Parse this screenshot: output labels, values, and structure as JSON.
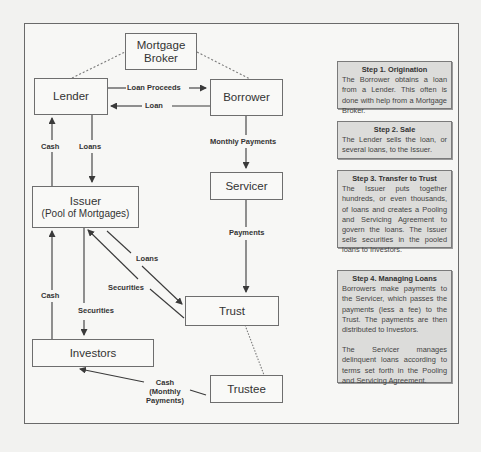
{
  "diagram": {
    "nodes": {
      "mortgage_broker": {
        "line1": "Mortgage",
        "line2": "Broker"
      },
      "lender": {
        "label": "Lender"
      },
      "borrower": {
        "label": "Borrower"
      },
      "issuer": {
        "label": "Issuer",
        "sub": "(Pool of Mortgages)"
      },
      "servicer": {
        "label": "Servicer"
      },
      "trust": {
        "label": "Trust"
      },
      "investors": {
        "label": "Investors"
      },
      "trustee": {
        "label": "Trustee"
      }
    },
    "edges": {
      "loan_proceeds": "Loan Proceeds",
      "loan": "Loan",
      "cash_lender": "Cash",
      "loans_lender": "Loans",
      "monthly_payments": "Monthly Payments",
      "payments": "Payments",
      "loans_trust": "Loans",
      "securities_issuer": "Securities",
      "cash_investors": "Cash",
      "securities_investors": "Securities",
      "cash_monthly_1": "Cash",
      "cash_monthly_2": "(Monthly",
      "cash_monthly_3": "Payments)"
    },
    "colors": {
      "line": "#3a3a3a",
      "dashed": "#7a7a7a",
      "step_bg": "#dcdcda",
      "node_border": "#6e6e6e"
    }
  },
  "steps": [
    {
      "title": "Step 1. Origination",
      "paragraphs": [
        "The Borrower obtains a loan from a Lender. This often is done with help from a Mortgage Broker."
      ]
    },
    {
      "title": "Step 2. Sale",
      "paragraphs": [
        "The Lender sells the loan, or several loans, to the Issuer."
      ]
    },
    {
      "title": "Step 3. Transfer to Trust",
      "paragraphs": [
        "The Issuer puts together hundreds, or even thousands, of loans and creates a Pooling and Servicing Agreement to govern the loans. The Issuer sells securities in the pooled loans to Investors."
      ]
    },
    {
      "title": "Step 4. Managing Loans",
      "paragraphs": [
        "Borrowers make payments to the Servicer, which passes the payments (less a fee) to the Trust. The payments are then distributed to Investors.",
        "The Servicer manages delinquent loans according to terms set forth in the Pooling and Servicing Agreement."
      ]
    }
  ]
}
